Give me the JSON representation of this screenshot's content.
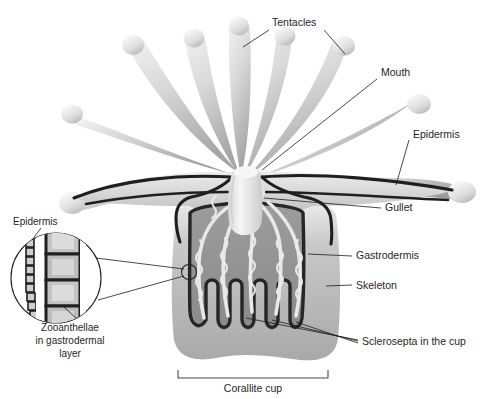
{
  "figure": {
    "background_color": "#ffffff",
    "ink_color": "#1c1c1c"
  },
  "palette": {
    "tentacle_light": "#f2f2f2",
    "tentacle_mid": "#c9c9c9",
    "tentacle_dark": "#9a9a9a",
    "body_light": "#e3e3e3",
    "body_mid": "#b5b5b5",
    "skeleton_gray": "#a8a8a8",
    "cup_interior": "#8f8f8f",
    "outline_dark": "#1f1f1f",
    "filament_light": "#e6e6e6",
    "inset_cell_fill": "#b0b0b0",
    "inset_cell_light": "#d6d6d6",
    "label_text": "#262626"
  },
  "labels": {
    "tentacles": "Tentacles",
    "mouth": "Mouth",
    "epidermis_right": "Epidermis",
    "gullet": "Gullet",
    "gastrodermis": "Gastrodermis",
    "skeleton": "Skeleton",
    "sclerosepta": "Sclerosepta in the cup",
    "corallite_cup": "Corallite cup",
    "inset_epidermis": "Epidermis",
    "inset_zoo_line1": "Zooanthellae",
    "inset_zoo_line2": "in gastrodermal",
    "inset_zoo_line3": "layer"
  },
  "structures": {
    "tentacle_count": 9,
    "septa_count": 4,
    "inset_epidermis_cells": 11,
    "inset_gastrodermal_cells": 4
  }
}
